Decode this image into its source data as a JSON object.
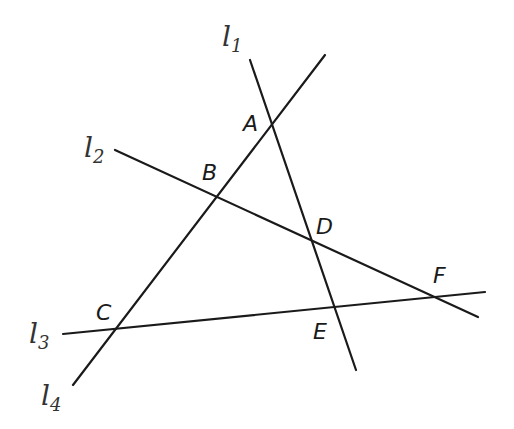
{
  "diagram": {
    "type": "intersecting-lines",
    "lines": [
      {
        "id": "l1",
        "label": "l",
        "sub": "1",
        "x1": 250,
        "y1": 60,
        "x2": 356,
        "y2": 370,
        "lx": 222,
        "ly": 46
      },
      {
        "id": "l2",
        "label": "l",
        "sub": "2",
        "x1": 115,
        "y1": 150,
        "x2": 478,
        "y2": 317,
        "lx": 84,
        "ly": 157
      },
      {
        "id": "l3",
        "label": "l",
        "sub": "3",
        "x1": 63,
        "y1": 334,
        "x2": 485,
        "y2": 292,
        "lx": 29,
        "ly": 343
      },
      {
        "id": "l4",
        "label": "l",
        "sub": "4",
        "x1": 73,
        "y1": 385,
        "x2": 325,
        "y2": 55,
        "lx": 41,
        "ly": 405
      }
    ],
    "points": [
      {
        "label": "A",
        "x": 243,
        "y": 131
      },
      {
        "label": "B",
        "x": 202,
        "y": 180
      },
      {
        "label": "C",
        "x": 96,
        "y": 320
      },
      {
        "label": "D",
        "x": 316,
        "y": 234
      },
      {
        "label": "E",
        "x": 313,
        "y": 339
      },
      {
        "label": "F",
        "x": 433,
        "y": 283
      }
    ],
    "stroke_color": "#1a1a1a",
    "background": "#ffffff"
  }
}
